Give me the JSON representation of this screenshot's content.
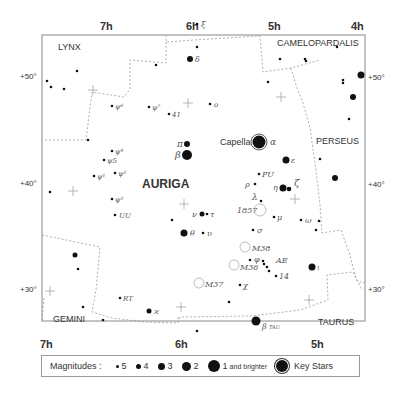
{
  "chart": {
    "constellation": "AURIGA",
    "neighbors": [
      "LYNX",
      "CAMELOPARDALIS",
      "PERSEUS",
      "GEMINI",
      "TAURUS"
    ],
    "ra_top": [
      "7h",
      "6h",
      "5h",
      "4h"
    ],
    "ra_bottom": [
      "7h",
      "6h",
      "5h"
    ],
    "dec_left": [
      "+50°",
      "+40°",
      "+30°"
    ],
    "dec_right": [
      "+50°",
      "+40°",
      "+30°"
    ]
  },
  "stars": [
    {
      "name": "Capella",
      "greek": "α",
      "mag": "key"
    },
    {
      "greek": "β",
      "mag": 2
    },
    {
      "greek": "θ",
      "mag": 3
    },
    {
      "greek": "ι",
      "mag": 3
    },
    {
      "greek": "ε",
      "mag": 3
    },
    {
      "greek": "η",
      "mag": 3
    },
    {
      "greek": "ζ",
      "mag": 4
    },
    {
      "greek": "δ",
      "mag": 4
    },
    {
      "greek": "π",
      "mag": 4
    },
    {
      "greek": "ν",
      "mag": 4
    },
    {
      "greek": "τ",
      "mag": 5
    },
    {
      "greek": "υ",
      "mag": 5
    },
    {
      "greek": "ξ",
      "mag": 5
    },
    {
      "greek": "o",
      "mag": 5
    },
    {
      "greek": "λ",
      "mag": 5
    },
    {
      "greek": "μ",
      "mag": 5
    },
    {
      "greek": "σ",
      "mag": 5
    },
    {
      "greek": "ω",
      "mag": 5
    },
    {
      "greek": "φ",
      "mag": 5
    },
    {
      "greek": "χ",
      "mag": 5
    },
    {
      "greek": "ϰ",
      "mag": 4
    },
    {
      "greek": "ρ",
      "mag": 5
    },
    {
      "greek": "ψ1",
      "mag": 5
    },
    {
      "greek": "ψ2",
      "mag": 5
    },
    {
      "greek": "ψ3",
      "mag": 5
    },
    {
      "greek": "ψ4",
      "mag": 5
    },
    {
      "greek": "ψ5",
      "mag": 5
    },
    {
      "greek": "ψ6",
      "mag": 5
    },
    {
      "greek": "ψ7",
      "mag": 5
    },
    {
      "greek": "β Tau",
      "mag": 2
    }
  ],
  "labels": {
    "capella": "Capella",
    "alpha": "α",
    "beta": "β",
    "theta": "θ",
    "iota": "ι",
    "epsilon": "ε",
    "eta": "η",
    "zeta": "ζ",
    "delta": "δ",
    "pi": "π",
    "nu": "ν",
    "tau": "τ",
    "upsilon": "υ",
    "xi": "ξ",
    "omicron": "o",
    "lambda": "λ",
    "mu": "μ",
    "sigma": "σ",
    "omega": "ω",
    "phi": "φ",
    "chi": "χ",
    "kappa": "ϰ",
    "rho": "ρ",
    "psi1": "ψ¹",
    "psi2": "ψ²",
    "psi3": "ψ³",
    "psi4": "ψ⁴",
    "psi5": "ψ5",
    "psi6": "ψ⁶",
    "psi7": "ψ⁷",
    "n41": "41",
    "n14": "14",
    "PU": "PU",
    "UU": "UU",
    "RT": "RT",
    "AE": "AE",
    "n1857": "1857",
    "M36": "M36",
    "M37": "M37",
    "M38": "M38",
    "betaTau": "β",
    "tau_sub": "TAU"
  },
  "legend": {
    "title": "Magnitudes :",
    "items": [
      {
        "label": "5",
        "size": 3
      },
      {
        "label": "4",
        "size": 5
      },
      {
        "label": "3",
        "size": 7
      },
      {
        "label": "2",
        "size": 9
      },
      {
        "label": "1",
        "suffix": "and brighter",
        "size": 12
      }
    ],
    "key_label": "Key Stars"
  }
}
